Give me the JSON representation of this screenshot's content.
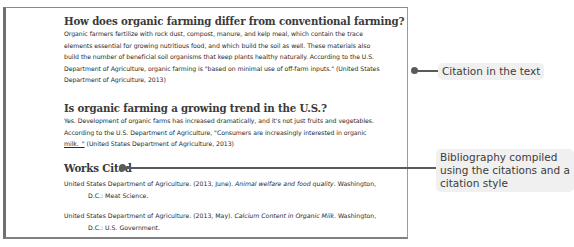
{
  "document": {
    "sections": [
      {
        "heading": "How does organic farming differ from conventional farming?",
        "lines": [
          "Organic farmers fertilize with rock dust, compost, manure, and kelp meal, which contain the trace",
          "elements essential for growing nutritious food, and which build the soil as well. These materials also",
          "build the number of beneficial soil organisms that keep plants healthy naturally. According  to the U.S.",
          "Department of Agriculture, organic farming is \"based on minimal use of off-farm inputs.\" (United States",
          "Department of Agriculture, 2013)"
        ]
      },
      {
        "heading": "Is organic farming a growing trend in the U.S.?",
        "lines": [
          "Yes. Development  of organic farms has increased dramatically, and it's not just fruits and vegetables.",
          "According to the U.S. Department  of Agriculture, \"Consumers  are increasingly interested in organic"
        ],
        "last_line_underlined": "milk._\"",
        "last_line_rest": " (United States Department of Agriculture, 2013)"
      }
    ],
    "works_cited": {
      "heading": "Works Cited",
      "entries": [
        {
          "prefix": "United States Department of Agriculture. (2013, June). ",
          "title": "Animal welfare and food quality",
          "suffix": ". Washington,",
          "continuation": "D.C.: Meat Science."
        },
        {
          "prefix": "United States Department of Agriculture. (2013, May). ",
          "title": "Calcium Content in Organic Milk",
          "suffix": ". Washington,",
          "continuation": "D.C.: U.S. Government."
        }
      ]
    }
  },
  "callouts": {
    "citation": "Citation in the text",
    "bibliography_lines": [
      "Bibliography compiled",
      "using the citations and a",
      "citation style"
    ]
  },
  "colors": {
    "connector": "#5a5a5a",
    "callout_bg": "#f0f0f0",
    "heading": "#3a3a3a"
  }
}
